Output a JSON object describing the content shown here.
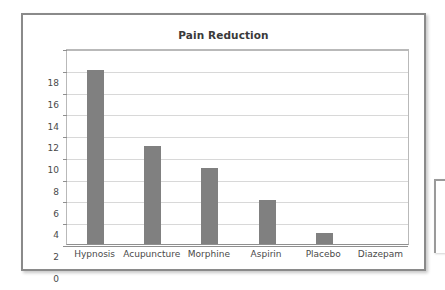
{
  "chart_data": {
    "type": "bar",
    "title": "Pain Reduction",
    "xlabel": "",
    "ylabel": "",
    "categories": [
      "Hypnosis",
      "Acupuncture",
      "Morphine",
      "Aspirin",
      "Placebo",
      "Diazepam"
    ],
    "values": [
      16,
      9,
      7,
      4,
      1,
      0
    ],
    "ylim": [
      0,
      18
    ],
    "ytick_step": 2,
    "yticks": [
      18,
      16,
      14,
      12,
      10,
      8,
      6,
      4,
      2,
      0
    ],
    "grid": true,
    "legend": false,
    "series": [
      {
        "name": "Pain Reduction",
        "values": [
          16,
          9,
          7,
          4,
          1,
          0
        ],
        "color": "#808080"
      }
    ]
  },
  "style": {
    "bar_color": "#808080",
    "gridline_color": "#d8d8d8",
    "axis_color": "#8f8f8f",
    "plot_border_color": "#b9b9b9",
    "frame_border_color": "#8a8a8a",
    "title_color": "#3a3a3a",
    "tick_label_color": "#4a4a4a",
    "background_color": "#ffffff"
  }
}
